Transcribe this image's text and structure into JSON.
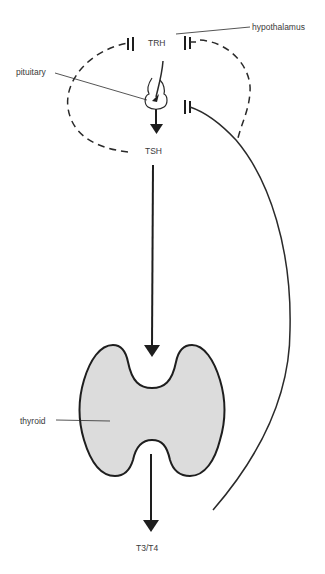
{
  "diagram": {
    "nodes": {
      "trh": "TRH",
      "tsh": "TSH",
      "t3t4": "T3/T4"
    },
    "labels": {
      "hypothalamus": "hypothalamus",
      "pituitary": "pituitary",
      "thyroid": "thyroid"
    },
    "edges": [
      {
        "from": "TRH",
        "to": "pituitary",
        "type": "stimulates"
      },
      {
        "from": "pituitary",
        "to": "TSH",
        "type": "releases"
      },
      {
        "from": "TSH",
        "to": "thyroid",
        "type": "stimulates"
      },
      {
        "from": "thyroid",
        "to": "T3/T4",
        "type": "releases"
      },
      {
        "from": "T3/T4",
        "to": "hypothalamus",
        "type": "inhibits"
      },
      {
        "from": "T3/T4",
        "to": "pituitary",
        "type": "inhibits"
      },
      {
        "from": "TSH",
        "to": "hypothalamus",
        "type": "inhibits (short loop)"
      }
    ],
    "colors": {
      "line": "#2a2a2a",
      "thyroid_fill": "#dcdcdc",
      "thyroid_outline": "#1e1e1e",
      "text": "#3a3a3a"
    }
  }
}
